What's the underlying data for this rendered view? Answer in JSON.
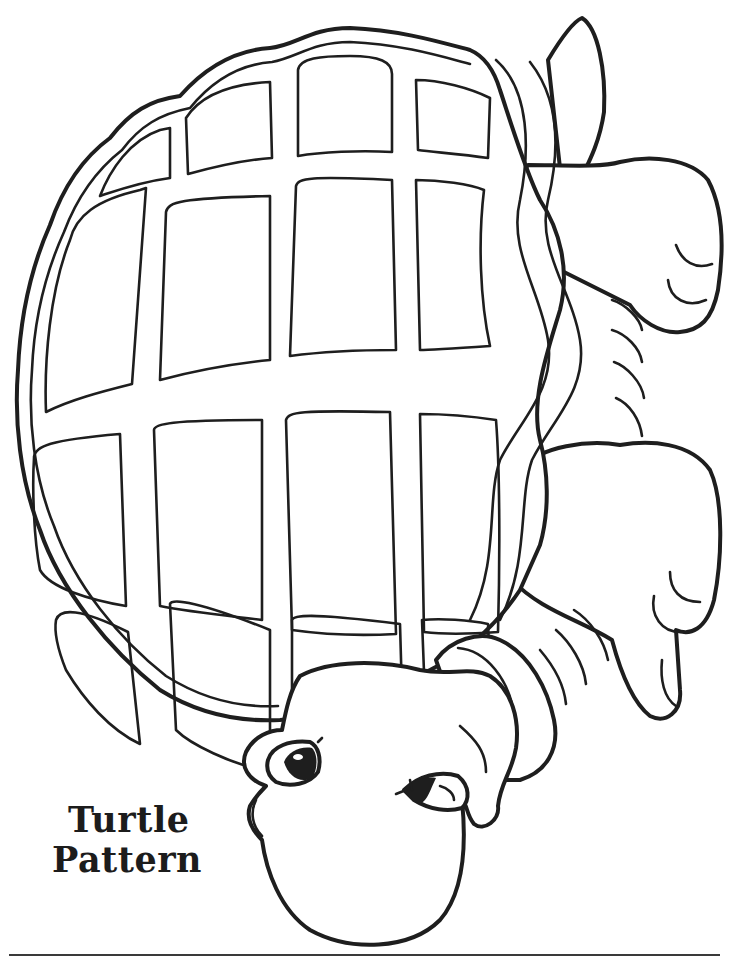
{
  "page": {
    "title_line1": "Turtle",
    "title_line2": "Pattern",
    "background": "#ffffff",
    "ink_color": "#1e1e1e"
  },
  "illustration": {
    "subject": "turtle",
    "shell_rows": 5,
    "shell_columns": 4
  }
}
